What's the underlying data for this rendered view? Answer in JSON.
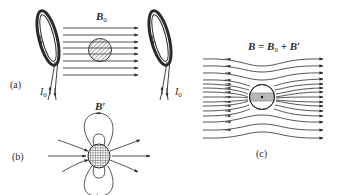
{
  "figure": {
    "panels": [
      {
        "id": "a",
        "label": "(a)",
        "field_label": "B",
        "field_subscript": "0",
        "current_label_left": "I",
        "current_label_left_sub": "0",
        "current_label_right": "I",
        "current_label_right_sub": "0",
        "description": "Uniform field between two coils with superconducting sample"
      },
      {
        "id": "b",
        "label": "(b)",
        "field_label": "B′",
        "description": "Dipole field of induced currents in sample"
      },
      {
        "id": "c",
        "label": "(c)",
        "field_label": "B = B",
        "field_label_sub": "0",
        "field_label_rest": " + B′",
        "description": "Resulting field excluded from sample"
      }
    ],
    "colors": {
      "line": "#2a2a2a",
      "hatch": "#555555",
      "sample_fill": "#b8b8b8",
      "background": "#ffffff"
    }
  }
}
